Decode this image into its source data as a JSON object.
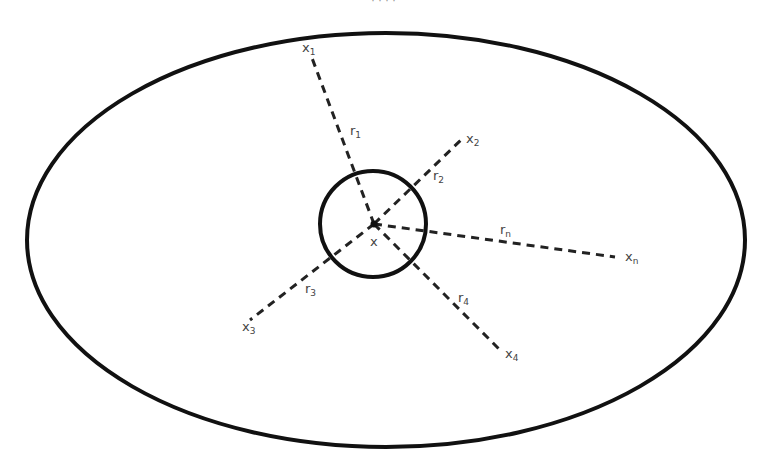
{
  "caption": "· · · · ",
  "diagram": {
    "outer_region": {
      "shape": "ellipse",
      "cx": 386,
      "cy": 240,
      "rx": 359,
      "ry": 207,
      "stroke": "#111111",
      "stroke_width": 4
    },
    "neighborhood": {
      "shape": "circle",
      "cx": 373,
      "cy": 224,
      "r": 53,
      "stroke": "#111111",
      "stroke_width": 4
    },
    "center": {
      "x": 374,
      "y": 224,
      "label": "x",
      "label_x": 370,
      "label_y": 246
    },
    "rays": [
      {
        "id": "1",
        "to": [
          312,
          58
        ],
        "point_label": "x",
        "point_sub": "1",
        "point_lx": 302,
        "point_ly": 52,
        "dist_label": "r",
        "dist_sub": "1",
        "dist_lx": 350,
        "dist_ly": 135
      },
      {
        "id": "2",
        "to": [
          463,
          138
        ],
        "point_label": "x",
        "point_sub": "2",
        "point_lx": 466,
        "point_ly": 143,
        "dist_label": "r",
        "dist_sub": "2",
        "dist_lx": 433,
        "dist_ly": 180
      },
      {
        "id": "n",
        "to": [
          615,
          257
        ],
        "point_label": "x",
        "point_sub": "n",
        "point_lx": 625,
        "point_ly": 261,
        "dist_label": "r",
        "dist_sub": "n",
        "dist_lx": 500,
        "dist_ly": 234
      },
      {
        "id": "3",
        "to": [
          250,
          320
        ],
        "point_label": "x",
        "point_sub": "3",
        "point_lx": 242,
        "point_ly": 331,
        "dist_label": "r",
        "dist_sub": "3",
        "dist_lx": 305,
        "dist_ly": 293
      },
      {
        "id": "4",
        "to": [
          500,
          350
        ],
        "point_label": "x",
        "point_sub": "4",
        "point_lx": 505,
        "point_ly": 358,
        "dist_label": "r",
        "dist_sub": "4",
        "dist_lx": 458,
        "dist_ly": 302
      }
    ],
    "ray_style": {
      "stroke": "#222222",
      "stroke_width": 3,
      "dash": "8 6"
    },
    "label_color": "#444444"
  }
}
